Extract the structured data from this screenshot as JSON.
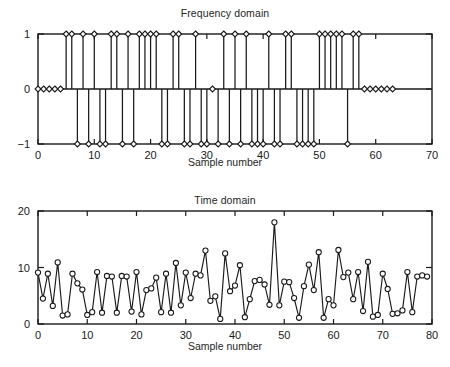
{
  "figure": {
    "background": "#ffffff",
    "line_color": "#1a1a1a",
    "marker_fill": "#ffffff"
  },
  "charts": {
    "top": {
      "title": "Frequency domain",
      "xlabel": "Sample number",
      "ylabel": "",
      "xticks": [
        "0",
        "10",
        "20",
        "30",
        "40",
        "50",
        "60",
        "70"
      ],
      "yticks": [
        "1",
        "0",
        "−1"
      ]
    },
    "bottom": {
      "title": "Time domain",
      "xlabel": "Sample number",
      "ylabel": "",
      "xticks": [
        "0",
        "10",
        "20",
        "30",
        "40",
        "50",
        "60",
        "70",
        "80"
      ],
      "yticks": [
        "20",
        "10",
        "0"
      ]
    }
  },
  "chart_data": [
    {
      "id": "frequency-domain",
      "type": "line",
      "plot_style": "stem",
      "title": "Frequency domain",
      "xlabel": "Sample number",
      "ylabel": "",
      "xlim": [
        0,
        70
      ],
      "ylim": [
        -1,
        1
      ],
      "xticks": [
        0,
        10,
        20,
        30,
        40,
        50,
        60,
        70
      ],
      "yticks": [
        -1,
        0,
        1
      ],
      "grid": false,
      "legend": false,
      "marker": "diamond",
      "x": [
        0,
        1,
        2,
        3,
        4,
        5,
        6,
        7,
        8,
        9,
        10,
        11,
        12,
        13,
        14,
        15,
        16,
        17,
        18,
        19,
        20,
        21,
        22,
        23,
        24,
        25,
        26,
        27,
        28,
        29,
        30,
        31,
        32,
        33,
        34,
        35,
        36,
        37,
        38,
        39,
        40,
        41,
        42,
        43,
        44,
        45,
        46,
        47,
        48,
        49,
        50,
        51,
        52,
        53,
        54,
        55,
        56,
        57,
        58,
        59,
        60,
        61,
        62,
        63
      ],
      "values": [
        0,
        0,
        0,
        0,
        0,
        1,
        1,
        -1,
        1,
        -1,
        1,
        -1,
        -1,
        1,
        1,
        -1,
        1,
        -1,
        1,
        1,
        1,
        1,
        -1,
        -1,
        1,
        1,
        -1,
        -1,
        1,
        -1,
        -1,
        0,
        -1,
        1,
        -1,
        1,
        -1,
        1,
        -1,
        -1,
        -1,
        1,
        -1,
        -1,
        1,
        1,
        -1,
        -1,
        -1,
        -1,
        1,
        1,
        1,
        1,
        1,
        -1,
        1,
        1,
        0,
        0,
        0,
        0,
        0,
        0
      ]
    },
    {
      "id": "time-domain",
      "type": "line",
      "plot_style": "line-markers",
      "title": "Time domain",
      "xlabel": "Sample number",
      "ylabel": "",
      "xlim": [
        0,
        80
      ],
      "ylim": [
        0,
        20
      ],
      "xticks": [
        0,
        10,
        20,
        30,
        40,
        50,
        60,
        70,
        80
      ],
      "yticks": [
        0,
        10,
        20
      ],
      "grid": false,
      "legend": false,
      "marker": "circle",
      "x": [
        0,
        1,
        2,
        3,
        4,
        5,
        6,
        7,
        8,
        9,
        10,
        11,
        12,
        13,
        14,
        15,
        16,
        17,
        18,
        19,
        20,
        21,
        22,
        23,
        24,
        25,
        26,
        27,
        28,
        29,
        30,
        31,
        32,
        33,
        34,
        35,
        36,
        37,
        38,
        39,
        40,
        41,
        42,
        43,
        44,
        45,
        46,
        47,
        48,
        49,
        50,
        51,
        52,
        53,
        54,
        55,
        56,
        57,
        58,
        59,
        60,
        61,
        62,
        63,
        64,
        65,
        66,
        67,
        68,
        69,
        70,
        71,
        72,
        73,
        74,
        75,
        76,
        77,
        78,
        79
      ],
      "values": [
        9.1,
        4.5,
        8.9,
        3.2,
        10.9,
        1.5,
        1.7,
        8.9,
        7.2,
        6.1,
        1.6,
        2.1,
        9.2,
        2.0,
        8.5,
        8.4,
        2.0,
        8.5,
        8.4,
        2.2,
        9.2,
        1.7,
        6.0,
        6.3,
        8.2,
        2.1,
        8.9,
        2.0,
        10.8,
        3.3,
        9.1,
        4.6,
        8.9,
        8.6,
        13.0,
        4.1,
        4.9,
        0.9,
        12.5,
        5.8,
        6.8,
        10.4,
        1.2,
        4.4,
        7.6,
        7.8,
        7.0,
        3.4,
        18.0,
        3.3,
        7.5,
        7.4,
        4.6,
        1.1,
        6.7,
        10.5,
        6.0,
        12.7,
        1.1,
        4.4,
        3.3,
        13.1,
        8.3,
        9.1,
        4.4,
        9.2,
        2.3,
        11.0,
        1.3,
        1.6,
        8.9,
        6.2,
        1.8,
        1.9,
        2.4,
        9.2,
        2.1,
        8.4,
        8.6,
        8.4
      ]
    }
  ]
}
